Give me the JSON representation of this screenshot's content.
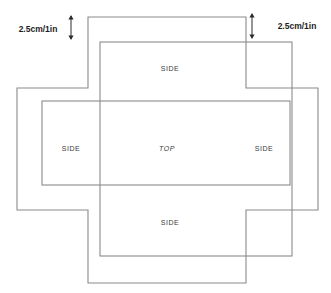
{
  "diagram": {
    "line_color": "#8a8a8a",
    "arrow_color": "#2b2b2b",
    "background_color": "#ffffff",
    "face_labels": [
      {
        "name": "side-top",
        "text": "SIDE",
        "x": 170,
        "y": 68,
        "italic": false
      },
      {
        "name": "side-left",
        "text": "SIDE",
        "x": 71,
        "y": 148,
        "italic": false
      },
      {
        "name": "top-face",
        "text": "TOP",
        "x": 167,
        "y": 148,
        "italic": true
      },
      {
        "name": "side-right",
        "text": "SIDE",
        "x": 264,
        "y": 148,
        "italic": false
      },
      {
        "name": "side-bottom",
        "text": "SIDE",
        "x": 170,
        "y": 222,
        "italic": false
      }
    ],
    "dimensions": [
      {
        "name": "left-margin-dimension",
        "text": "2.5cm/1in",
        "label_x": 38,
        "label_y": 29,
        "arrow_x": 71,
        "arrow_top": 15,
        "arrow_bottom": 40
      },
      {
        "name": "right-margin-dimension",
        "text": "2.5cm/1in",
        "label_x": 297,
        "label_y": 26,
        "arrow_x": 252,
        "arrow_top": 13,
        "arrow_bottom": 39
      }
    ],
    "shapes": {
      "outer_cross": "M 88,17 L 246,17 L 246,88 L 318,88 L 318,210 L 246,210 L 246,283 L 88,283 L 88,210 L 17,210 L 17,88 L 88,88 Z",
      "vertical_panel_rect": {
        "x": 100,
        "y": 42,
        "width": 192,
        "height": 214
      },
      "horizontal_panel_rect": {
        "x": 42,
        "y": 101,
        "width": 248,
        "height": 84
      }
    }
  }
}
